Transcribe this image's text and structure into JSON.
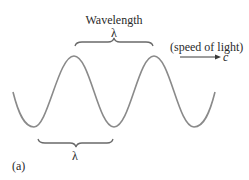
{
  "diagram": {
    "top_label": "Wavelength",
    "top_symbol": "λ",
    "bottom_symbol": "λ",
    "speed_label": "(speed of light)",
    "speed_symbol": "c",
    "panel_label": "(a)",
    "colors": {
      "wave": "#8a8a8a",
      "brace": "#6a6a6a",
      "arrow": "#3a3a3a",
      "text": "#2a2a2a"
    }
  }
}
